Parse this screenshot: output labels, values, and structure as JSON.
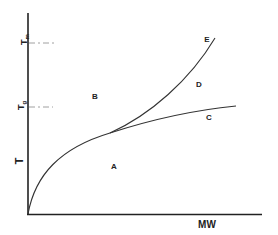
{
  "diagram": {
    "axes": {
      "y_label": "T",
      "x_label": "MW",
      "y_ticks": [
        {
          "label": "Tm",
          "main": "T",
          "sub": "m"
        },
        {
          "label": "Tg",
          "main": "T",
          "sub": "g"
        }
      ]
    },
    "regions": {
      "A": "A",
      "B": "B",
      "C": "C",
      "D": "D",
      "E": "E"
    },
    "curves": [
      {
        "name": "Tm curve",
        "end_label": "E"
      },
      {
        "name": "Tg curve",
        "end_label": "C"
      }
    ],
    "colors": {
      "line": "#333333",
      "dash": "#888888"
    }
  }
}
